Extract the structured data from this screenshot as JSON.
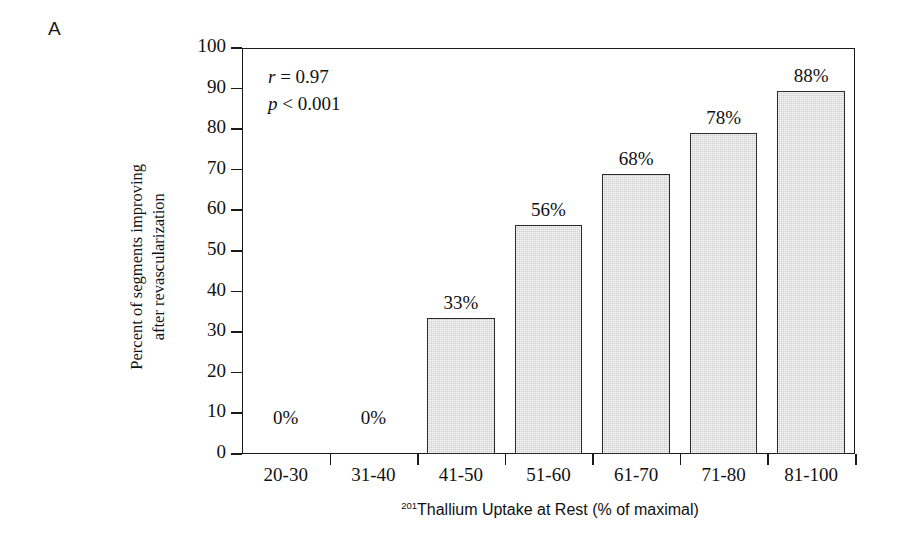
{
  "panel": {
    "label": "A"
  },
  "chart_data": {
    "type": "bar",
    "title": "",
    "categories": [
      "20-30",
      "31-40",
      "41-50",
      "51-60",
      "61-70",
      "71-80",
      "81-100"
    ],
    "values": [
      0,
      0,
      33,
      56,
      68,
      78,
      88
    ],
    "bar_tops": [
      0,
      0,
      33.5,
      56.5,
      69,
      79,
      89.5
    ],
    "data_labels": [
      "0%",
      "0%",
      "33%",
      "56%",
      "68%",
      "78%",
      "88%"
    ],
    "xlabel": "Thallium Uptake at Rest (% of maximal)",
    "xlabel_superscript": "201",
    "ylabel_line1": "Percent of segments improving",
    "ylabel_line2": "after revascularization",
    "ylim": [
      0,
      100
    ],
    "yticks": [
      0,
      10,
      20,
      30,
      40,
      50,
      60,
      70,
      80,
      90,
      100
    ],
    "ytick_labels": [
      "0",
      "10",
      "20",
      "30",
      "40",
      "50",
      "60",
      "70",
      "80",
      "90",
      "100"
    ],
    "grid": false,
    "legend": "none",
    "bar_color": "#cfcfcf",
    "bar_edge_color": "#2b2b2b",
    "axis_color": "#1a1a1a"
  },
  "annotations": {
    "r_symbol": "r",
    "r_text": " = 0.97",
    "p_symbol": "p",
    "p_text": " < 0.001"
  }
}
